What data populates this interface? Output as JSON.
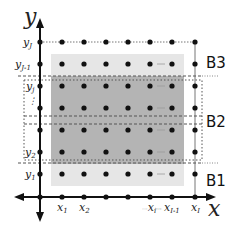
{
  "axes": {
    "x_label": "x",
    "y_label": "y"
  },
  "x_ticks": [
    "x1",
    "x2",
    "",
    "",
    "xi",
    "xI-1",
    "xI"
  ],
  "y_ticks": [
    "yJ",
    "yJ-1",
    "yj",
    "",
    "",
    "y2",
    "y1"
  ],
  "x_tick_labels": {
    "x1": "x",
    "x1_sub": "1",
    "x2": "x",
    "x2_sub": "2",
    "xi_prefix": "···",
    "xi": "x",
    "xi_sub": "i",
    "xi_mid": "···",
    "xI1": "x",
    "xI1_sub": "I-1",
    "xI": "x",
    "xI_sub": "I"
  },
  "y_tick_labels": {
    "yJ": "y",
    "yJ_sub": "J",
    "yJ1": "y",
    "yJ1_sub": "J-1",
    "yj": "y",
    "yj_sub": "j",
    "yj_dots": "⋮",
    "y2": "y",
    "y2_sub": "2",
    "y1": "y",
    "y1_sub": "1"
  },
  "blocks": [
    {
      "name": "B3",
      "label": "B3"
    },
    {
      "name": "B2",
      "label": "B2"
    },
    {
      "name": "B1",
      "label": "B1"
    }
  ],
  "colors": {
    "light_region": "#e6e6e6",
    "dark_region": "#b4b4b4",
    "point": "#111111",
    "axis": "#111111",
    "dash": "#555555"
  }
}
